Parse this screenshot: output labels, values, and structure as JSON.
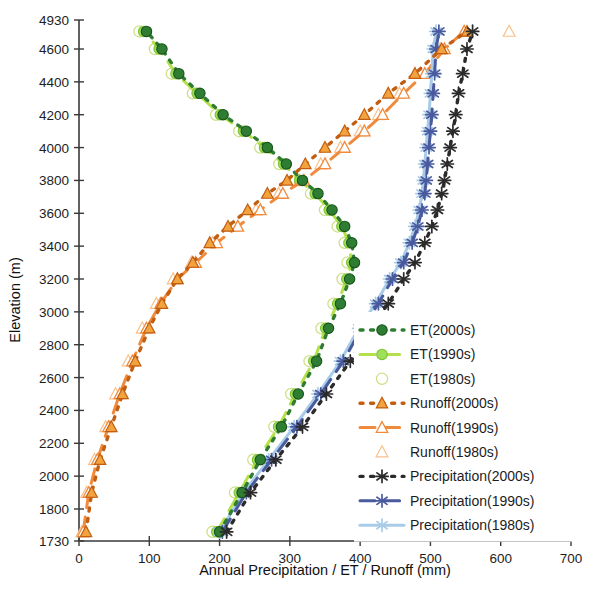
{
  "chart_data": {
    "type": "line",
    "title": "",
    "xlabel": "Annual Precipitation / ET / Runoff (mm)",
    "ylabel": "Elevation (m)",
    "xlim": [
      0,
      700
    ],
    "ylim": [
      1730,
      4930
    ],
    "xticks": [
      0,
      100,
      200,
      300,
      400,
      500,
      600,
      700
    ],
    "yticks": [
      1730,
      1800,
      2000,
      2200,
      2400,
      2600,
      2800,
      3000,
      3200,
      3400,
      3600,
      3800,
      4000,
      4200,
      4400,
      4600,
      4930
    ],
    "grid": false,
    "legend_position": "center-right",
    "orientation": "y-is-elevation",
    "series": [
      {
        "name": "ET(2000s)",
        "color": "#2e7d32",
        "marker": "filled-circle",
        "line": "dotted",
        "x": [
          200,
          232,
          258,
          288,
          312,
          338,
          355,
          372,
          385,
          392,
          388,
          378,
          360,
          340,
          318,
          295,
          268,
          238,
          205,
          172,
          142,
          118,
          96
        ],
        "y": [
          1750,
          1900,
          2100,
          2300,
          2500,
          2700,
          2900,
          3050,
          3200,
          3300,
          3420,
          3520,
          3620,
          3720,
          3800,
          3900,
          4000,
          4100,
          4200,
          4330,
          4450,
          4600,
          4800
        ]
      },
      {
        "name": "ET(1990s)",
        "color": "#b5e04a",
        "marker": "light-filled-circle",
        "line": "dashed",
        "x": [
          196,
          228,
          254,
          284,
          308,
          334,
          351,
          368,
          381,
          388,
          384,
          374,
          356,
          336,
          314,
          291,
          264,
          234,
          201,
          168,
          138,
          114,
          92
        ],
        "y": [
          1750,
          1900,
          2100,
          2300,
          2500,
          2700,
          2900,
          3050,
          3200,
          3300,
          3420,
          3520,
          3620,
          3720,
          3800,
          3900,
          4000,
          4100,
          4200,
          4330,
          4450,
          4600,
          4800
        ]
      },
      {
        "name": "ET(1980s)",
        "color": "#cfe08a",
        "marker": "open-circle",
        "line": "none",
        "x": [
          190,
          222,
          248,
          278,
          302,
          328,
          345,
          362,
          375,
          382,
          378,
          368,
          350,
          330,
          308,
          285,
          258,
          228,
          195,
          162,
          132,
          108,
          86
        ],
        "y": [
          1750,
          1900,
          2100,
          2300,
          2500,
          2700,
          2900,
          3050,
          3200,
          3300,
          3420,
          3520,
          3620,
          3720,
          3800,
          3900,
          4000,
          4100,
          4200,
          4330,
          4450,
          4600,
          4800
        ]
      },
      {
        "name": "Runoff(2000s)",
        "color": "#c25e12",
        "marker": "filled-triangle",
        "line": "dotted",
        "x": [
          10,
          18,
          30,
          46,
          62,
          80,
          100,
          118,
          140,
          162,
          186,
          212,
          240,
          268,
          296,
          322,
          350,
          378,
          406,
          440,
          478,
          516,
          552
        ],
        "y": [
          1750,
          1900,
          2100,
          2300,
          2500,
          2700,
          2900,
          3050,
          3200,
          3300,
          3420,
          3520,
          3620,
          3720,
          3800,
          3900,
          4000,
          4100,
          4200,
          4330,
          4450,
          4600,
          4800
        ]
      },
      {
        "name": "Runoff(1990s)",
        "color": "#f08a3c",
        "marker": "open-triangle",
        "line": "dashed",
        "x": [
          6,
          14,
          26,
          42,
          58,
          76,
          96,
          116,
          140,
          166,
          196,
          226,
          258,
          290,
          320,
          350,
          378,
          406,
          432,
          462,
          492,
          520,
          548
        ],
        "y": [
          1750,
          1900,
          2100,
          2300,
          2500,
          2700,
          2900,
          3050,
          3200,
          3300,
          3420,
          3520,
          3620,
          3720,
          3800,
          3900,
          4000,
          4100,
          4200,
          4330,
          4450,
          4600,
          4800
        ]
      },
      {
        "name": "Runoff(1980s)",
        "color": "#f9c08a",
        "marker": "open-triangle-light",
        "line": "none",
        "x": [
          4,
          11,
          22,
          38,
          52,
          70,
          90,
          110,
          134,
          160,
          190,
          220,
          252,
          284,
          314,
          344,
          372,
          400,
          426,
          456,
          486,
          514,
          612
        ],
        "y": [
          1750,
          1900,
          2100,
          2300,
          2500,
          2700,
          2900,
          3050,
          3200,
          3300,
          3420,
          3520,
          3620,
          3720,
          3800,
          3900,
          4000,
          4100,
          4200,
          4330,
          4450,
          4600,
          4800
        ]
      },
      {
        "name": "Precipitation(2000s)",
        "color": "#2b2b2b",
        "marker": "starburst-dark",
        "line": "dotted",
        "x": [
          210,
          244,
          280,
          318,
          352,
          386,
          414,
          440,
          462,
          478,
          492,
          502,
          510,
          516,
          520,
          524,
          528,
          532,
          536,
          540,
          546,
          552,
          560
        ],
        "y": [
          1750,
          1900,
          2100,
          2300,
          2500,
          2700,
          2900,
          3050,
          3200,
          3300,
          3420,
          3520,
          3620,
          3720,
          3800,
          3900,
          4000,
          4100,
          4200,
          4330,
          4450,
          4600,
          4800
        ]
      },
      {
        "name": "Precipitation(1990s)",
        "color": "#4a5a9e",
        "marker": "starburst-blue",
        "line": "dashed",
        "x": [
          204,
          238,
          274,
          310,
          344,
          376,
          402,
          426,
          446,
          462,
          474,
          482,
          488,
          492,
          494,
          496,
          498,
          500,
          502,
          504,
          506,
          508,
          512
        ],
        "y": [
          1750,
          1900,
          2100,
          2300,
          2500,
          2700,
          2900,
          3050,
          3200,
          3300,
          3420,
          3520,
          3620,
          3720,
          3800,
          3900,
          4000,
          4100,
          4200,
          4330,
          4450,
          4600,
          4800
        ]
      },
      {
        "name": "Precipitation(1980s)",
        "color": "#a8cbe8",
        "marker": "starburst-light",
        "line": "solid",
        "x": [
          200,
          234,
          270,
          306,
          340,
          372,
          398,
          422,
          442,
          458,
          470,
          478,
          484,
          488,
          490,
          492,
          494,
          496,
          498,
          500,
          502,
          504,
          508
        ],
        "y": [
          1750,
          1900,
          2100,
          2300,
          2500,
          2700,
          2900,
          3050,
          3200,
          3300,
          3420,
          3520,
          3620,
          3720,
          3800,
          3900,
          4000,
          4100,
          4200,
          4330,
          4450,
          4600,
          4800
        ]
      }
    ],
    "legend": [
      {
        "label": "ET(2000s)",
        "color": "#2e7d32",
        "marker": "filled-circle",
        "line": "dotted"
      },
      {
        "label": "ET(1990s)",
        "color": "#b5e04a",
        "marker": "light-filled-circle",
        "line": "dashed"
      },
      {
        "label": "ET(1980s)",
        "color": "#cfe08a",
        "marker": "open-circle",
        "line": "none"
      },
      {
        "label": "Runoff(2000s)",
        "color": "#c25e12",
        "marker": "filled-triangle",
        "line": "dotted"
      },
      {
        "label": "Runoff(1990s)",
        "color": "#f08a3c",
        "marker": "open-triangle",
        "line": "dashed"
      },
      {
        "label": "Runoff(1980s)",
        "color": "#f9c08a",
        "marker": "open-triangle-light",
        "line": "none"
      },
      {
        "label": "Precipitation(2000s)",
        "color": "#2b2b2b",
        "marker": "starburst-dark",
        "line": "dotted"
      },
      {
        "label": "Precipitation(1990s)",
        "color": "#4a5a9e",
        "marker": "starburst-blue",
        "line": "dashed"
      },
      {
        "label": "Precipitation(1980s)",
        "color": "#a8cbe8",
        "marker": "starburst-light",
        "line": "solid"
      }
    ]
  }
}
